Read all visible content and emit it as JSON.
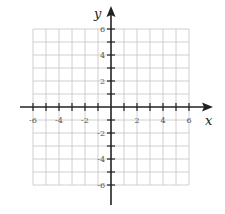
{
  "figure": {
    "title": "",
    "x_axis": {
      "label": "x",
      "min": -6,
      "max": 6,
      "labeled_ticks": [
        -6,
        -4,
        -2,
        2,
        4,
        6
      ]
    },
    "y_axis": {
      "label": "y",
      "min": -6,
      "max": 6,
      "labeled_ticks": [
        6,
        4,
        2,
        -2,
        -4,
        -6
      ]
    },
    "grid": {
      "step": 1,
      "range": [
        -6,
        6
      ],
      "color": "#bbbbbb"
    },
    "axis_color": "#222222"
  },
  "labels": {
    "x": "x",
    "y": "y",
    "xt": [
      "-6",
      "-4",
      "-2",
      "2",
      "4",
      "6"
    ],
    "yt": [
      "6",
      "4",
      "2",
      "-2",
      "-4",
      "-6"
    ]
  }
}
